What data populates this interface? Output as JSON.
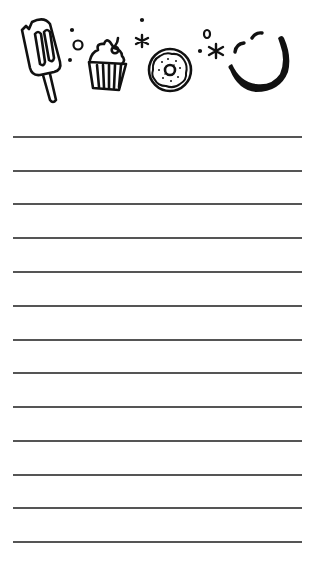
{
  "page": {
    "type": "lined-notepad",
    "background": "#ffffff",
    "ink_color": "#111111",
    "rule_color": "#555555"
  },
  "header": {
    "icons": [
      "popsicle-icon",
      "cupcake-icon",
      "donut-icon",
      "smile-icon",
      "sparkle-icon",
      "circle-dot-icon"
    ]
  },
  "ruled_lines": {
    "count": 13,
    "start_y": 136,
    "spacing": 33.75,
    "x_start": 13,
    "x_end": 302
  }
}
